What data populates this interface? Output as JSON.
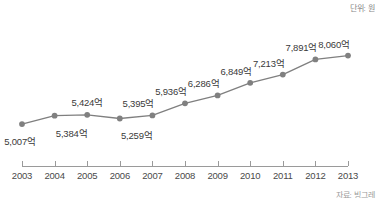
{
  "chart_data": {
    "type": "line",
    "title": "",
    "subtitle": "",
    "unit_note": "단위: 원",
    "source_note": "자료: 빙그레",
    "xlabel": "",
    "ylabel": "",
    "grid": false,
    "legend": "none",
    "categories": [
      "2003",
      "2004",
      "2005",
      "2006",
      "2007",
      "2008",
      "2009",
      "2010",
      "2011",
      "2012",
      "2013"
    ],
    "values": [
      5007,
      5384,
      5424,
      5259,
      5395,
      5936,
      6286,
      6849,
      7213,
      7891,
      8060
    ],
    "value_labels": [
      "5,007억",
      "5,384억",
      "5,424억",
      "5,259억",
      "5,395억",
      "5,936억",
      "6,286억",
      "6,849억",
      "7,213억",
      "7,891억",
      "8,060억"
    ],
    "ylim": [
      4700,
      8400
    ],
    "series": [
      {
        "name": "매출액",
        "values": [
          5007,
          5384,
          5424,
          5259,
          5395,
          5936,
          6286,
          6849,
          7213,
          7891,
          8060
        ],
        "color": "#7f7f7f",
        "marker": "circle"
      }
    ],
    "label_positions": [
      "below-left",
      "below-right",
      "above",
      "below-right",
      "above-left",
      "above-left",
      "above-left",
      "above-left",
      "above-left",
      "above-left",
      "above-left"
    ],
    "colors": {
      "line": "#7f7f7f",
      "marker": "#808080",
      "axis": "#9a9a9a",
      "label_text": "#3a3a3a",
      "tick_text": "#4a4a4a",
      "note_text": "#888888",
      "background": "#ffffff"
    }
  }
}
